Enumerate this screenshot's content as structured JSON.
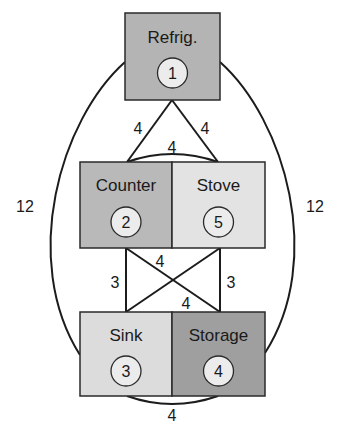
{
  "diagram": {
    "nodes": [
      {
        "id": 1,
        "label": "Refrig.",
        "number": "1",
        "fill": "#b4b4b4"
      },
      {
        "id": 2,
        "label": "Counter",
        "number": "2",
        "fill": "#b9b9b9"
      },
      {
        "id": 5,
        "label": "Stove",
        "number": "5",
        "fill": "#e3e3e3"
      },
      {
        "id": 3,
        "label": "Sink",
        "number": "3",
        "fill": "#dcdcdc"
      },
      {
        "id": 4,
        "label": "Storage",
        "number": "4",
        "fill": "#9f9f9f"
      }
    ],
    "edges": [
      {
        "from": 1,
        "to": 2,
        "weight": "4"
      },
      {
        "from": 1,
        "to": 5,
        "weight": "4"
      },
      {
        "from": 2,
        "to": 5,
        "weight": "4"
      },
      {
        "from": 1,
        "to": 3,
        "weight": "12"
      },
      {
        "from": 1,
        "to": 4,
        "weight": "12"
      },
      {
        "from": 2,
        "to": 3,
        "weight": "3"
      },
      {
        "from": 5,
        "to": 4,
        "weight": "3"
      },
      {
        "from": 2,
        "to": 4,
        "weight": "4"
      },
      {
        "from": 5,
        "to": 3,
        "weight": "4"
      },
      {
        "from": 3,
        "to": 4,
        "weight": "4"
      }
    ]
  }
}
